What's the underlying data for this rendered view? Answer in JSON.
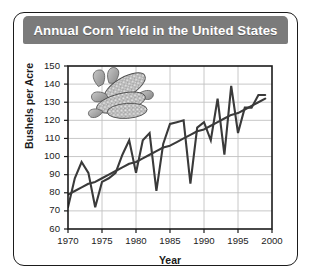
{
  "figure": {
    "title": "Annual Corn Yield in the United States",
    "title_bar_color": "#7b7b7b",
    "frame_color": "#1b1b1b",
    "background": "#ffffff"
  },
  "decoration": {
    "corn_illustration": "corn-cobs-icon"
  },
  "chart_data": {
    "type": "line",
    "title": "Annual Corn Yield in the United States",
    "xlabel": "Year",
    "ylabel": "Bushels per Acre",
    "xlim": [
      1970,
      2000
    ],
    "ylim": [
      60,
      150
    ],
    "grid": true,
    "legend": "none",
    "xticks": [
      1970,
      1975,
      1980,
      1985,
      1990,
      1995,
      2000
    ],
    "yticks": [
      60,
      70,
      80,
      90,
      100,
      110,
      120,
      130,
      140,
      150
    ],
    "x": [
      1970,
      1971,
      1972,
      1973,
      1974,
      1975,
      1976,
      1977,
      1978,
      1979,
      1980,
      1981,
      1982,
      1983,
      1984,
      1985,
      1986,
      1987,
      1988,
      1989,
      1990,
      1991,
      1992,
      1993,
      1994,
      1995,
      1996,
      1997,
      1998,
      1999
    ],
    "series": [
      {
        "name": "Annual corn yield",
        "color": "#3a3a3a",
        "values": [
          72,
          88,
          97,
          91,
          72,
          86,
          88,
          91,
          101,
          109,
          91,
          109,
          113,
          81,
          107,
          118,
          119,
          120,
          85,
          116,
          119,
          109,
          132,
          101,
          139,
          113,
          127,
          127,
          134,
          134
        ]
      },
      {
        "name": "Trend line",
        "color": "#3a3a3a",
        "type": "trend",
        "values": [
          79,
          81,
          83,
          85,
          86,
          88,
          90,
          92,
          94,
          96,
          97,
          99,
          101,
          103,
          105,
          106,
          108,
          110,
          112,
          114,
          115,
          117,
          119,
          121,
          123,
          124,
          126,
          128,
          130,
          132
        ]
      }
    ]
  }
}
